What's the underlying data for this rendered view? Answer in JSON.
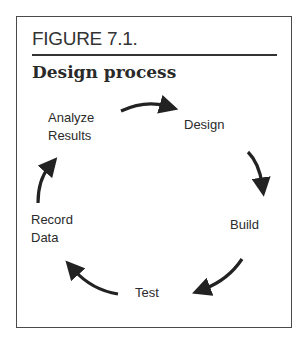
{
  "figure": {
    "label": "FIGURE 7.1.",
    "title": "Design process"
  },
  "cycle": {
    "nodes": [
      {
        "id": "analyze",
        "line1": "Analyze",
        "line2": "Results"
      },
      {
        "id": "design",
        "line1": "Design"
      },
      {
        "id": "build",
        "line1": "Build"
      },
      {
        "id": "test",
        "line1": "Test"
      },
      {
        "id": "record",
        "line1": "Record",
        "line2": "Data"
      }
    ],
    "edges": [
      {
        "from": "Analyze Results",
        "to": "Design"
      },
      {
        "from": "Design",
        "to": "Build"
      },
      {
        "from": "Build",
        "to": "Test"
      },
      {
        "from": "Test",
        "to": "Record Data"
      },
      {
        "from": "Record Data",
        "to": "Analyze Results"
      }
    ]
  },
  "colors": {
    "ink": "#222222",
    "border": "#4a4a4a"
  }
}
